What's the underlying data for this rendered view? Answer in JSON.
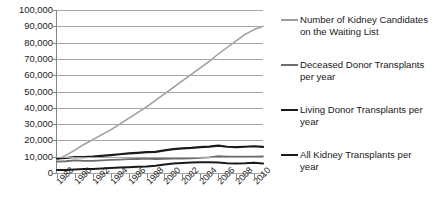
{
  "chart_data": {
    "type": "line",
    "title": "",
    "xlabel": "",
    "ylabel": "",
    "grid": true,
    "legend_position": "right",
    "ylim": [
      0,
      100000
    ],
    "ytick_labels": [
      "100,000",
      "90,000",
      "80,000",
      "70,000",
      "60,000",
      "50,000",
      "40,000",
      "30,000",
      "20,000",
      "10,000",
      "0"
    ],
    "ytick_values": [
      100000,
      90000,
      80000,
      70000,
      60000,
      50000,
      40000,
      30000,
      20000,
      10000,
      0
    ],
    "x": [
      1988,
      1989,
      1990,
      1991,
      1992,
      1993,
      1994,
      1995,
      1996,
      1997,
      1998,
      1999,
      2000,
      2001,
      2002,
      2003,
      2004,
      2005,
      2006,
      2007,
      2008,
      2009,
      2010,
      2011
    ],
    "xtick_labels": [
      "1988",
      "1990",
      "1992",
      "1994",
      "1996",
      "1998",
      "2000",
      "2002",
      "2004",
      "2006",
      "2008",
      "2010"
    ],
    "xtick_values": [
      1988,
      1990,
      1992,
      1994,
      1996,
      1998,
      2000,
      2002,
      2004,
      2006,
      2008,
      2010
    ],
    "series": [
      {
        "name": "Number of Kidney Candidates on the Waiting List",
        "color": "#9c9c9c",
        "width": 1.5,
        "values": [
          8000,
          11000,
          14000,
          17500,
          20500,
          23500,
          26500,
          30000,
          33500,
          37000,
          40500,
          44500,
          48500,
          52500,
          56500,
          60500,
          64500,
          68500,
          73000,
          77000,
          81000,
          85000,
          88000,
          90000
        ]
      },
      {
        "name": "Deceased Donor Transplants per year",
        "color": "#6e6e6e",
        "width": 1.8,
        "values": [
          7000,
          7200,
          7700,
          7400,
          7400,
          7700,
          8000,
          8200,
          8500,
          8600,
          8800,
          8600,
          8700,
          8800,
          8900,
          9000,
          9300,
          9600,
          10400,
          10100,
          10000,
          10100,
          10100,
          10200
        ]
      },
      {
        "name": "Living Donor Transplants per year",
        "color": "#1a1a1a",
        "width": 2.0,
        "values": [
          1800,
          1900,
          2100,
          2400,
          2500,
          2800,
          3000,
          3300,
          3500,
          3800,
          4000,
          4400,
          5200,
          5800,
          6200,
          6400,
          6600,
          6600,
          6400,
          6000,
          5900,
          6000,
          6300,
          5800
        ]
      },
      {
        "name": "All Kidney Transplants per year",
        "color": "#1a1a1a",
        "width": 2.2,
        "values": [
          9000,
          9200,
          9800,
          9800,
          10000,
          10500,
          11000,
          11500,
          12000,
          12400,
          12800,
          13000,
          13900,
          14600,
          15100,
          15400,
          15900,
          16200,
          16800,
          16100,
          15900,
          16100,
          16400,
          16000
        ]
      }
    ]
  },
  "legend": {
    "entries": [
      {
        "label": "Number of Kidney Candidates on the Waiting List"
      },
      {
        "label": "Deceased Donor Transplants per year"
      },
      {
        "label": "Living Donor Transplants per year"
      },
      {
        "label": "All Kidney Transplants per year"
      }
    ]
  }
}
